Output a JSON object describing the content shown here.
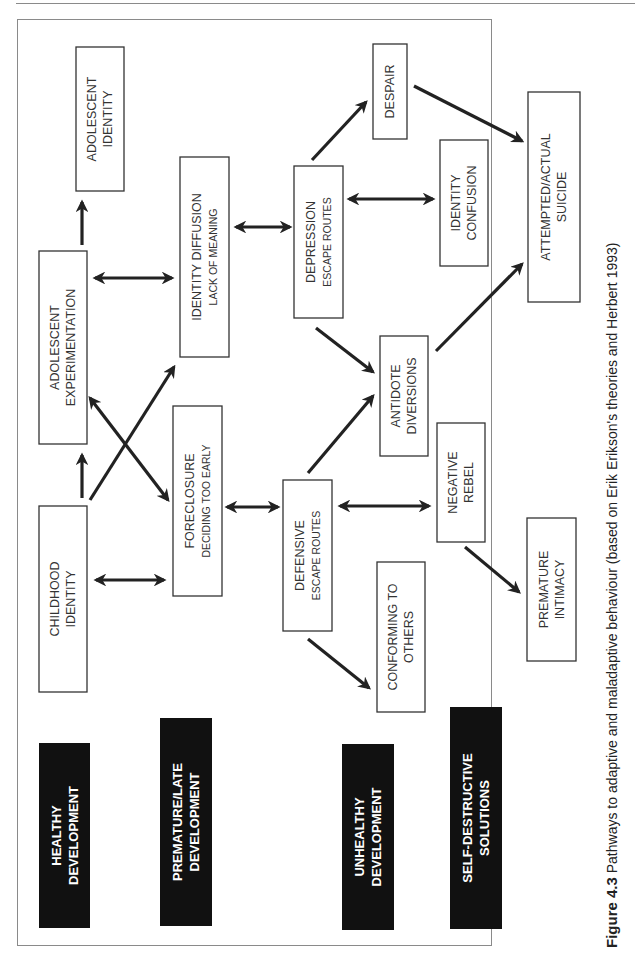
{
  "diagram": {
    "boxes": {
      "adolescent_identity": {
        "line1": "ADOLESCENT",
        "line2": "IDENTITY"
      },
      "identity_diffusion": {
        "line1": "IDENTITY DIFFUSION",
        "line2": "LACK OF MEANING"
      },
      "adolescent_experimentation": {
        "line1": "ADOLESCENT",
        "line2": "EXPERIMENTATION"
      },
      "childhood_identity": {
        "line1": "CHILDHOOD",
        "line2": "IDENTITY"
      },
      "foreclosure": {
        "line1": "FORECLOSURE",
        "line2": "DECIDING TOO EARLY"
      },
      "depression": {
        "line1": "DEPRESSION",
        "line2": "ESCAPE ROUTES"
      },
      "despair": {
        "line1": "DESPAIR"
      },
      "identity_confusion": {
        "line1": "IDENTITY",
        "line2": "CONFUSION"
      },
      "attempted_suicide": {
        "line1": "ATTEMPTED/ACTUAL",
        "line2": "SUICIDE"
      },
      "antidote_diversions": {
        "line1": "ANTIDOTE",
        "line2": "DIVERSIONS"
      },
      "negative_rebel": {
        "line1": "NEGATIVE",
        "line2": "REBEL"
      },
      "defensive": {
        "line1": "DEFENSIVE",
        "line2": "ESCAPE ROUTES"
      },
      "conforming": {
        "line1": "CONFORMING TO",
        "line2": "OTHERS"
      },
      "premature_intimacy": {
        "line1": "PREMATURE",
        "line2": "INTIMACY"
      }
    },
    "categories": {
      "healthy": {
        "line1": "HEALTHY",
        "line2": "DEVELOPMENT"
      },
      "premature_late": {
        "line1": "PREMATURE/LATE",
        "line2": "DEVELOPMENT"
      },
      "unhealthy": {
        "line1": "UNHEALTHY",
        "line2": "DEVELOPMENT"
      },
      "self_destructive": {
        "line1": "SELF-DESTRUCTIVE",
        "line2": "SOLUTIONS"
      }
    },
    "connections": [
      {
        "from": "Childhood Identity",
        "to": "Adolescent Experimentation",
        "type": "arrow"
      },
      {
        "from": "Adolescent Experimentation",
        "to": "Adolescent Identity",
        "type": "arrow"
      },
      {
        "from": "Adolescent Experimentation",
        "to": "Identity Diffusion",
        "type": "double"
      },
      {
        "from": "Childhood Identity",
        "to": "Foreclosure",
        "type": "double"
      },
      {
        "from": "Childhood Identity",
        "to": "Identity Diffusion",
        "type": "arrow"
      },
      {
        "from": "Adolescent Experimentation",
        "to": "Foreclosure",
        "type": "double"
      },
      {
        "from": "Identity Diffusion",
        "to": "Depression",
        "type": "double"
      },
      {
        "from": "Foreclosure",
        "to": "Defensive",
        "type": "double"
      },
      {
        "from": "Depression",
        "to": "Despair",
        "type": "arrow"
      },
      {
        "from": "Depression",
        "to": "Identity Confusion",
        "type": "double"
      },
      {
        "from": "Depression",
        "to": "Antidote Diversions",
        "type": "arrow"
      },
      {
        "from": "Despair",
        "to": "Attempted/Actual Suicide",
        "type": "arrow"
      },
      {
        "from": "Antidote Diversions",
        "to": "Attempted/Actual Suicide",
        "type": "arrow"
      },
      {
        "from": "Defensive",
        "to": "Antidote Diversions",
        "type": "arrow"
      },
      {
        "from": "Defensive",
        "to": "Negative Rebel",
        "type": "double"
      },
      {
        "from": "Defensive",
        "to": "Conforming to Others",
        "type": "arrow"
      },
      {
        "from": "Negative Rebel",
        "to": "Premature Intimacy",
        "type": "arrow"
      }
    ]
  },
  "caption": {
    "label": "Figure 4.3",
    "text": " Pathways to adaptive and maladaptive behaviour (based on Erik Erikson's theories and Herbert 1993)"
  }
}
